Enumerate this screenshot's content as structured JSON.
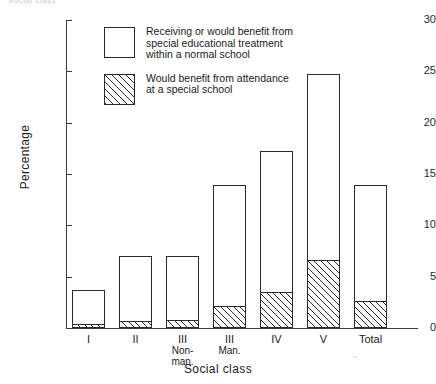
{
  "top_caption": "Social class",
  "axes": {
    "y_title": "Percentage",
    "x_title": "Social class",
    "y_ticks": [
      "0",
      "5",
      "10",
      "15",
      "20",
      "25",
      "30"
    ]
  },
  "legend": {
    "items": [
      {
        "swatch": "open-square",
        "lines": [
          "Receiving or would benefit from",
          "special educational treatment",
          "within a normal school"
        ]
      },
      {
        "swatch": "hatched-square",
        "lines": [
          "Would benefit from attendance",
          "at a special school"
        ]
      }
    ]
  },
  "chart_data": {
    "type": "bar",
    "title": "",
    "xlabel": "Social class",
    "ylabel": "Percentage",
    "ylim": [
      0,
      30
    ],
    "yticks": [
      0,
      5,
      10,
      15,
      20,
      25,
      30
    ],
    "grid": false,
    "legend_position": "inside-top-left",
    "stacked": true,
    "categories": [
      "I",
      "II",
      "III Non-man.",
      "III Man.",
      "IV",
      "V",
      "Total"
    ],
    "category_labels": [
      {
        "l1": "I",
        "l2": "",
        "l3": ""
      },
      {
        "l1": "II",
        "l2": "",
        "l3": ""
      },
      {
        "l1": "III",
        "l2": "Non-",
        "l3": "man."
      },
      {
        "l1": "III",
        "l2": "Man.",
        "l3": ""
      },
      {
        "l1": "IV",
        "l2": "",
        "l3": ""
      },
      {
        "l1": "V",
        "l2": "",
        "l3": ""
      },
      {
        "l1": "Total",
        "l2": "",
        "l3": ""
      }
    ],
    "series": [
      {
        "name": "Would benefit from attendance at a special school",
        "fill": "hatched",
        "values": [
          0.3,
          0.6,
          0.7,
          2.0,
          3.4,
          6.5,
          2.5
        ]
      },
      {
        "name": "Receiving or would benefit from special educational treatment within a normal school",
        "fill": "open",
        "values": [
          3.4,
          6.4,
          6.3,
          11.9,
          13.8,
          18.2,
          11.4
        ]
      }
    ],
    "totals": [
      3.7,
      7.0,
      7.0,
      13.9,
      17.2,
      24.7,
      13.9
    ]
  },
  "colors": {
    "ink": "#2a2a2a",
    "background": "#ffffff"
  }
}
